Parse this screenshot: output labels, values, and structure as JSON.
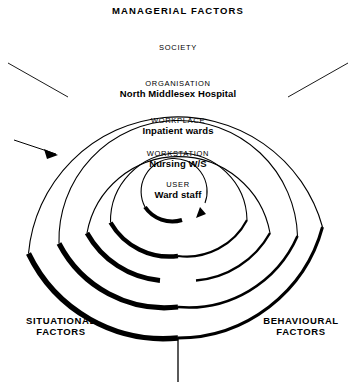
{
  "diagram": {
    "title": "MANAGERIAL FACTORS",
    "corner_labels": {
      "top": "MANAGERIAL FACTORS",
      "bottom_left_line1": "SITUATIONAL",
      "bottom_left_line2": "FACTORS",
      "bottom_right_line1": "BEHAVIOURAL",
      "bottom_right_line2": "FACTORS"
    },
    "rings": [
      {
        "caption": "SOCIETY",
        "value": ""
      },
      {
        "caption": "ORGANISATION",
        "value": "North Middlesex Hospital"
      },
      {
        "caption": "WORKPLACE",
        "value": "Inpatient wards"
      },
      {
        "caption": "WORKSTATION",
        "value": "Nursing W/S"
      },
      {
        "caption": "USER",
        "value": "Ward staff"
      }
    ],
    "colors": {
      "ink": "#000000",
      "background": "#ffffff",
      "thin_stroke": "#000000"
    }
  }
}
